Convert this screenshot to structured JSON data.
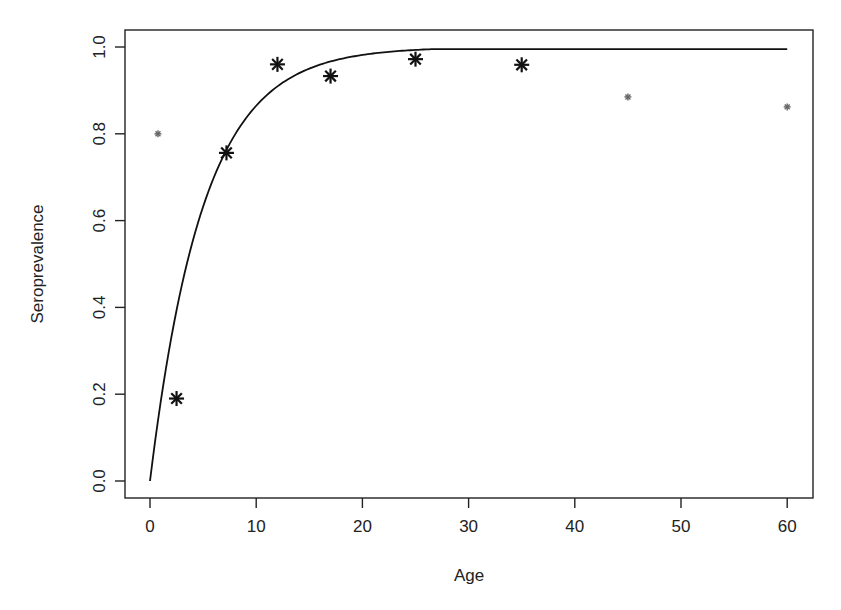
{
  "chart_data": {
    "type": "scatter",
    "title": "",
    "xlabel": "Age",
    "ylabel": "Seroprevalence",
    "xlim": [
      -1.5,
      62.5
    ],
    "ylim": [
      -0.04,
      1.04
    ],
    "x_ticks": [
      0,
      10,
      20,
      30,
      40,
      50,
      60
    ],
    "x_tick_labels": [
      "0",
      "10",
      "20",
      "30",
      "40",
      "50",
      "60"
    ],
    "y_ticks": [
      0.0,
      0.2,
      0.4,
      0.6,
      0.8,
      1.0
    ],
    "y_tick_labels": [
      "0.0",
      "0.2",
      "0.4",
      "0.6",
      "0.8",
      "1.0"
    ],
    "grid": false,
    "legend": null,
    "series": [
      {
        "name": "observed (large markers)",
        "marker": "asterisk",
        "size": "large",
        "color": "#111111",
        "x": [
          2.5,
          7.2,
          12.0,
          17.0,
          25.0,
          35.0
        ],
        "y": [
          0.19,
          0.756,
          0.96,
          0.933,
          0.972,
          0.959
        ]
      },
      {
        "name": "observed (small markers)",
        "marker": "asterisk",
        "size": "small",
        "color": "#666666",
        "x": [
          0.75,
          45.0,
          60.0
        ],
        "y": [
          0.8,
          0.885,
          0.862
        ]
      },
      {
        "name": "fitted curve",
        "type": "line",
        "color": "#111111",
        "formula": "1 - exp(-0.2 * age)",
        "x": [
          0,
          2,
          4,
          6,
          8,
          10,
          12,
          15,
          20,
          25,
          30,
          40,
          50,
          60
        ],
        "y": [
          0.0,
          0.33,
          0.551,
          0.699,
          0.798,
          0.865,
          0.909,
          0.95,
          0.982,
          0.993,
          0.998,
          1.0,
          1.0,
          0.995
        ]
      }
    ]
  },
  "axes": {
    "xlabel": "Age",
    "ylabel": "Seroprevalence"
  }
}
